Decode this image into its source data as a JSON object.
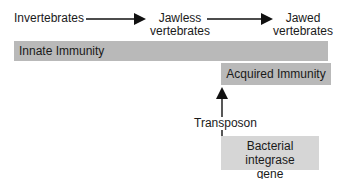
{
  "evolution": {
    "stages": [
      {
        "label": "Invertebrates"
      },
      {
        "label_line1": "Jawless",
        "label_line2": "vertebrates"
      },
      {
        "label_line1": "Jawed",
        "label_line2": "vertebrates"
      }
    ]
  },
  "bars": {
    "innate": "Innate Immunity",
    "acquired": "Acquired Immunity"
  },
  "origin": {
    "arrow_label": "Transposon",
    "box_line1": "Bacterial integrase",
    "box_line2": "gene"
  },
  "colors": {
    "bar": "#b9b9b9",
    "box": "#d6d6d6",
    "arrow": "#111111"
  }
}
